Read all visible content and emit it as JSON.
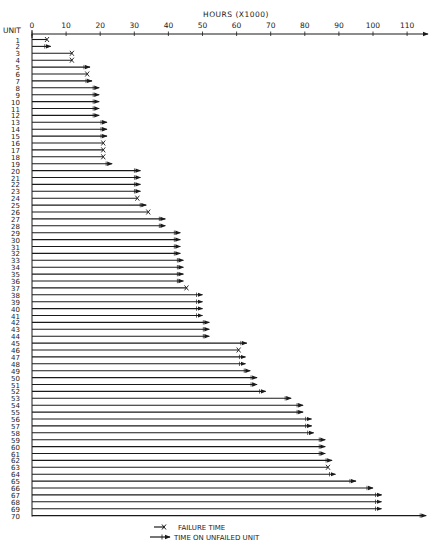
{
  "chart_data": {
    "type": "bar",
    "subtype": "horizontal-timeline",
    "title": "HOURS (X1000)",
    "xlabel": "HOURS (X1000)",
    "ylabel": "UNIT",
    "xlim": [
      0,
      115
    ],
    "x_ticks": [
      0,
      10,
      20,
      30,
      40,
      50,
      60,
      70,
      80,
      90,
      100,
      110
    ],
    "grid": false,
    "legend": [
      {
        "marker": "x",
        "label": "FAILURE TIME"
      },
      {
        "marker": "arrow",
        "label": "TIME ON UNFAILED UNIT"
      }
    ],
    "legend_position": "bottom-center",
    "units": [
      {
        "unit": 1,
        "hours": 4.4,
        "status": "failed"
      },
      {
        "unit": 2,
        "hours": 5.5,
        "status": "unfailed"
      },
      {
        "unit": 3,
        "hours": 11.7,
        "status": "failed"
      },
      {
        "unit": 4,
        "hours": 11.7,
        "status": "failed"
      },
      {
        "unit": 5,
        "hours": 17.0,
        "status": "unfailed"
      },
      {
        "unit": 6,
        "hours": 16.2,
        "status": "failed"
      },
      {
        "unit": 7,
        "hours": 17.6,
        "status": "unfailed"
      },
      {
        "unit": 8,
        "hours": 19.7,
        "status": "unfailed"
      },
      {
        "unit": 9,
        "hours": 19.7,
        "status": "unfailed"
      },
      {
        "unit": 10,
        "hours": 19.7,
        "status": "unfailed"
      },
      {
        "unit": 11,
        "hours": 19.7,
        "status": "unfailed"
      },
      {
        "unit": 12,
        "hours": 19.7,
        "status": "unfailed"
      },
      {
        "unit": 13,
        "hours": 22.0,
        "status": "unfailed"
      },
      {
        "unit": 14,
        "hours": 22.0,
        "status": "unfailed"
      },
      {
        "unit": 15,
        "hours": 22.0,
        "status": "unfailed"
      },
      {
        "unit": 16,
        "hours": 20.9,
        "status": "failed"
      },
      {
        "unit": 17,
        "hours": 20.9,
        "status": "failed"
      },
      {
        "unit": 18,
        "hours": 20.9,
        "status": "failed"
      },
      {
        "unit": 19,
        "hours": 23.5,
        "status": "unfailed"
      },
      {
        "unit": 20,
        "hours": 31.8,
        "status": "unfailed"
      },
      {
        "unit": 21,
        "hours": 31.8,
        "status": "unfailed"
      },
      {
        "unit": 22,
        "hours": 31.8,
        "status": "unfailed"
      },
      {
        "unit": 23,
        "hours": 31.8,
        "status": "unfailed"
      },
      {
        "unit": 24,
        "hours": 30.9,
        "status": "failed"
      },
      {
        "unit": 25,
        "hours": 33.5,
        "status": "unfailed"
      },
      {
        "unit": 26,
        "hours": 34.1,
        "status": "failed"
      },
      {
        "unit": 27,
        "hours": 39.1,
        "status": "unfailed"
      },
      {
        "unit": 28,
        "hours": 39.1,
        "status": "unfailed"
      },
      {
        "unit": 29,
        "hours": 43.5,
        "status": "unfailed"
      },
      {
        "unit": 30,
        "hours": 43.5,
        "status": "unfailed"
      },
      {
        "unit": 31,
        "hours": 43.5,
        "status": "unfailed"
      },
      {
        "unit": 32,
        "hours": 43.5,
        "status": "unfailed"
      },
      {
        "unit": 33,
        "hours": 44.4,
        "status": "unfailed"
      },
      {
        "unit": 34,
        "hours": 44.4,
        "status": "unfailed"
      },
      {
        "unit": 35,
        "hours": 44.4,
        "status": "unfailed"
      },
      {
        "unit": 36,
        "hours": 44.4,
        "status": "unfailed"
      },
      {
        "unit": 37,
        "hours": 45.3,
        "status": "failed"
      },
      {
        "unit": 38,
        "hours": 50.0,
        "status": "unfailed"
      },
      {
        "unit": 39,
        "hours": 50.0,
        "status": "unfailed"
      },
      {
        "unit": 40,
        "hours": 50.0,
        "status": "unfailed"
      },
      {
        "unit": 41,
        "hours": 50.0,
        "status": "unfailed"
      },
      {
        "unit": 42,
        "hours": 52.0,
        "status": "unfailed"
      },
      {
        "unit": 43,
        "hours": 52.0,
        "status": "unfailed"
      },
      {
        "unit": 44,
        "hours": 52.0,
        "status": "unfailed"
      },
      {
        "unit": 45,
        "hours": 63.0,
        "status": "unfailed"
      },
      {
        "unit": 46,
        "hours": 60.6,
        "status": "failed"
      },
      {
        "unit": 47,
        "hours": 62.6,
        "status": "unfailed"
      },
      {
        "unit": 48,
        "hours": 62.6,
        "status": "unfailed"
      },
      {
        "unit": 49,
        "hours": 64.0,
        "status": "unfailed"
      },
      {
        "unit": 50,
        "hours": 66.0,
        "status": "unfailed"
      },
      {
        "unit": 51,
        "hours": 66.0,
        "status": "unfailed"
      },
      {
        "unit": 52,
        "hours": 68.5,
        "status": "unfailed"
      },
      {
        "unit": 53,
        "hours": 76.0,
        "status": "unfailed"
      },
      {
        "unit": 54,
        "hours": 79.5,
        "status": "unfailed"
      },
      {
        "unit": 55,
        "hours": 79.5,
        "status": "unfailed"
      },
      {
        "unit": 56,
        "hours": 82.0,
        "status": "unfailed"
      },
      {
        "unit": 57,
        "hours": 82.0,
        "status": "unfailed"
      },
      {
        "unit": 58,
        "hours": 82.6,
        "status": "unfailed"
      },
      {
        "unit": 59,
        "hours": 86.0,
        "status": "unfailed"
      },
      {
        "unit": 60,
        "hours": 86.0,
        "status": "unfailed"
      },
      {
        "unit": 61,
        "hours": 86.0,
        "status": "unfailed"
      },
      {
        "unit": 62,
        "hours": 88.0,
        "status": "unfailed"
      },
      {
        "unit": 63,
        "hours": 86.8,
        "status": "failed"
      },
      {
        "unit": 64,
        "hours": 89.0,
        "status": "unfailed"
      },
      {
        "unit": 65,
        "hours": 95.0,
        "status": "unfailed"
      },
      {
        "unit": 66,
        "hours": 100.0,
        "status": "unfailed"
      },
      {
        "unit": 67,
        "hours": 102.5,
        "status": "unfailed"
      },
      {
        "unit": 68,
        "hours": 102.5,
        "status": "unfailed"
      },
      {
        "unit": 69,
        "hours": 102.5,
        "status": "unfailed"
      },
      {
        "unit": 70,
        "hours": 115.6,
        "status": "unfailed"
      }
    ]
  },
  "labels": {
    "axis_title": "HOURS (X1000)",
    "unit_label": "UNIT",
    "legend_failure": "FAILURE TIME",
    "legend_unfailed": "TIME ON UNFAILED UNIT"
  }
}
